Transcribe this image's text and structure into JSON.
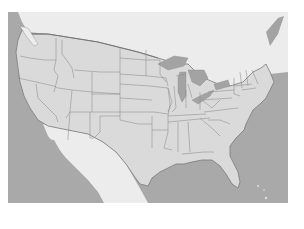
{
  "map": {
    "type": "political-outline",
    "region": "Contiguous United States",
    "colors": {
      "background": "#ffffff",
      "ocean": "#a9a9a9",
      "land_us": "#dadada",
      "land_foreign": "#ececec",
      "lakes": "#a3a3a3",
      "state_border": "#8c8c8c",
      "coastline": "#7a7a7a"
    },
    "labels": []
  }
}
